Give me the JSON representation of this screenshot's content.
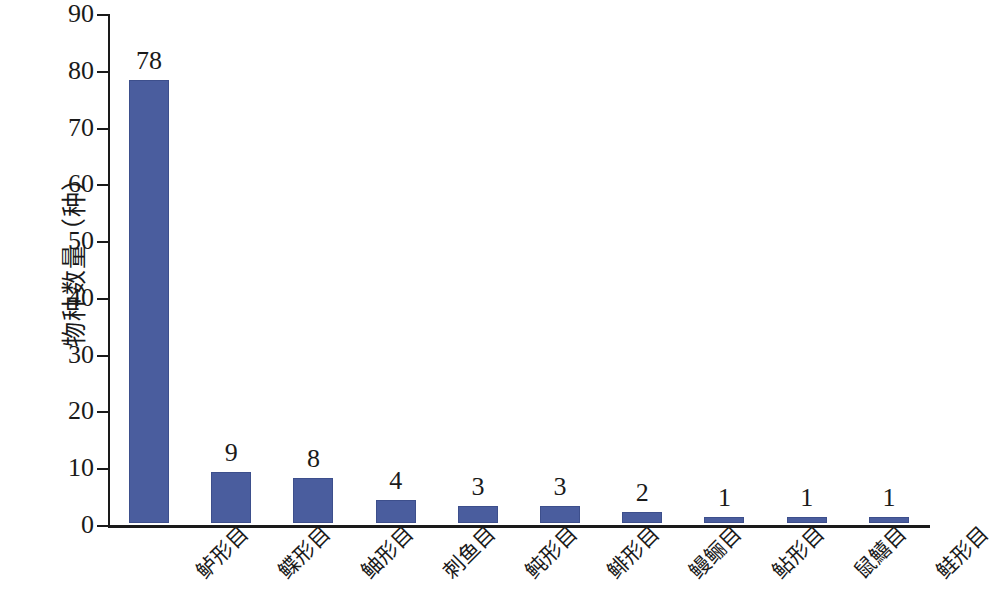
{
  "chart_data": {
    "type": "bar",
    "title": "",
    "subtitle": "",
    "xlabel": "",
    "ylabel": "物种数量（种）",
    "ylim": [
      0,
      90
    ],
    "ytick_step": 10,
    "yticks": [
      "90",
      "80",
      "70",
      "60",
      "50",
      "40",
      "30",
      "20",
      "10",
      "0"
    ],
    "grid": false,
    "legend": null,
    "bar_color": "#4a5d9e",
    "axis_color": "#1a1a1a",
    "categories": [
      "鲈形目",
      "鲽形目",
      "鲉形目",
      "刺鱼目",
      "鲀形目",
      "鲱形目",
      "鳗鲡目",
      "鲇形目",
      "鼠鱚目",
      "鲑形目"
    ],
    "values": [
      78,
      9,
      8,
      4,
      3,
      3,
      2,
      1,
      1,
      1
    ],
    "value_labels": [
      "78",
      "9",
      "8",
      "4",
      "3",
      "3",
      "2",
      "1",
      "1",
      "1"
    ]
  }
}
